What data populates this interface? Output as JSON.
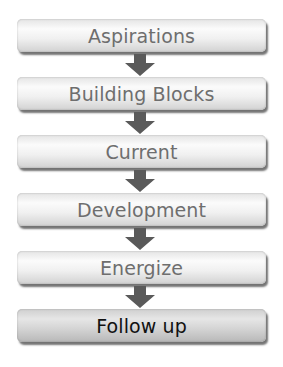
{
  "diagram": {
    "type": "vertical-flow",
    "steps": [
      {
        "label": "Aspirations"
      },
      {
        "label": "Building Blocks"
      },
      {
        "label": "Current"
      },
      {
        "label": "Development"
      },
      {
        "label": "Energize"
      },
      {
        "label": "Follow up"
      }
    ],
    "connector": "down-arrow-icon",
    "colors": {
      "arrow": "#5a5a5a",
      "text": "#6e6e6e",
      "last_text": "#111111"
    }
  }
}
